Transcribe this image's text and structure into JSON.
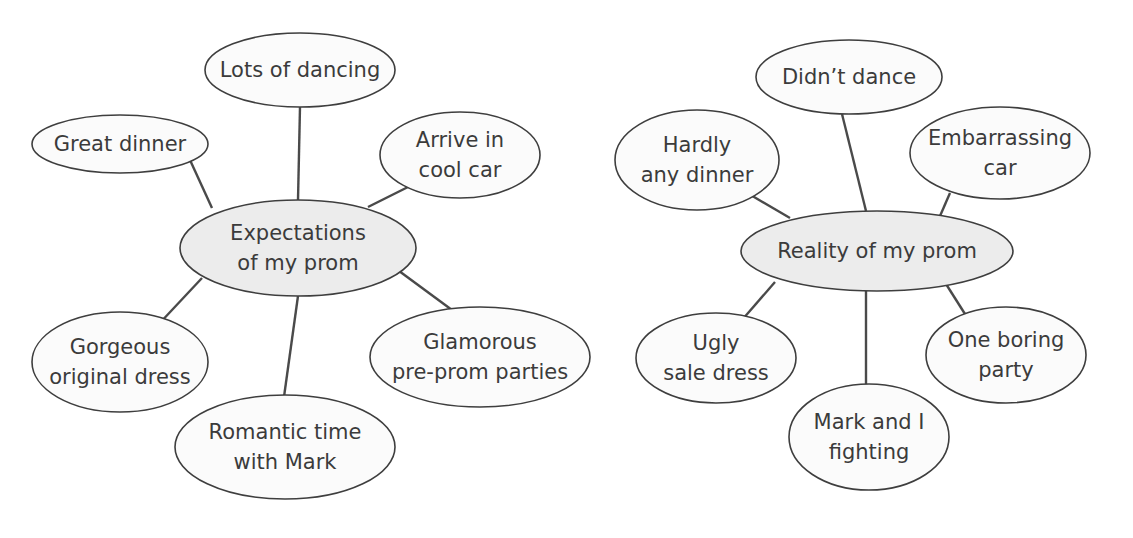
{
  "maps": [
    {
      "center": {
        "lines": [
          "Expectations",
          "of my prom"
        ]
      },
      "nodes": [
        {
          "lines": [
            "Lots of dancing"
          ]
        },
        {
          "lines": [
            "Great dinner"
          ]
        },
        {
          "lines": [
            "Arrive in",
            "cool car"
          ]
        },
        {
          "lines": [
            "Gorgeous",
            "original dress"
          ]
        },
        {
          "lines": [
            "Romantic time",
            "with Mark"
          ]
        },
        {
          "lines": [
            "Glamorous",
            "pre-prom parties"
          ]
        }
      ]
    },
    {
      "center": {
        "lines": [
          "Reality of my prom"
        ]
      },
      "nodes": [
        {
          "lines": [
            "Didn’t dance"
          ]
        },
        {
          "lines": [
            "Hardly",
            "any dinner"
          ]
        },
        {
          "lines": [
            "Embarrassing",
            "car"
          ]
        },
        {
          "lines": [
            "Ugly",
            "sale dress"
          ]
        },
        {
          "lines": [
            "Mark and I",
            "fighting"
          ]
        },
        {
          "lines": [
            "One boring",
            "party"
          ]
        }
      ]
    }
  ],
  "colors": {
    "center_fill": "#ececec",
    "node_fill": "#fbfbfb",
    "stroke": "#3e3e3e",
    "text": "#3b3b3b"
  }
}
